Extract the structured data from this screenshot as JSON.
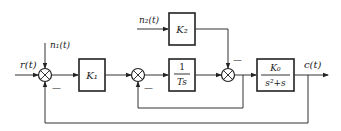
{
  "diagram": {
    "type": "control-system block diagram",
    "signals": {
      "input": "r(t)",
      "output": "c(t)",
      "disturbance_1": "n₁(t)",
      "disturbance_2": "n₂(t)"
    },
    "blocks": {
      "k1": {
        "label": "K₁"
      },
      "integrator": {
        "numerator": "1",
        "denominator": "Ts"
      },
      "k2": {
        "label": "K₂"
      },
      "plant": {
        "numerator": "K₀",
        "denominator": "s²+s"
      }
    },
    "summing_junctions": {
      "sum1": {
        "feedback_sign": "—"
      },
      "sum2": {
        "feedback_sign": "—"
      },
      "sum3": {
        "k2_sign": "—"
      }
    },
    "colors": {
      "line": "#333333",
      "block_border": "#222222",
      "background": "#ffffff"
    }
  }
}
